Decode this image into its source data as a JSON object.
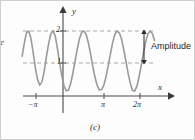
{
  "figure": {
    "caption": "(c)",
    "edge_fragment": "e",
    "axes": {
      "x_axis_label": "x",
      "y_axis_label": "y",
      "x_ticks": [
        {
          "label": "−π",
          "value": -3.14159,
          "px": 35
        },
        {
          "label": "π",
          "value": 3.14159,
          "px": 103
        },
        {
          "label": "2π",
          "value": 6.28319,
          "px": 139
        }
      ],
      "y_ticks": [
        {
          "label": "1",
          "value": 1,
          "px": 62
        },
        {
          "label": "2",
          "value": 2,
          "px": 30
        }
      ],
      "origin_px": {
        "x": 62,
        "y": 95
      },
      "x_arrow_tip_px": 170,
      "y_arrow_tip_px": 7
    },
    "annotation": {
      "label": "Amplitude",
      "arrow_x_px": 143,
      "arrow_top_px": 30,
      "arrow_bottom_px": 62,
      "label_x_px": 150,
      "label_y_px": 42
    },
    "guides": [
      {
        "name": "dashed-line-y-2",
        "y_value": 2,
        "y_px": 30,
        "style": "dashed"
      },
      {
        "name": "dashed-line-y-1",
        "y_value": 1,
        "y_px": 62,
        "style": "dashed"
      }
    ],
    "colors": {
      "curve": "#9a9a9a",
      "axis": "#4a4a4a",
      "dashed_guide": "#a9a9a9",
      "text": "#2b2b2b",
      "background": "#fdfdfd",
      "border": "#cfcfcf"
    }
  },
  "chart_data": {
    "type": "line",
    "title": "",
    "subtitle": "",
    "xlabel": "x",
    "ylabel": "y",
    "xlim": [
      -4.4,
      7.6
    ],
    "ylim": [
      -0.45,
      2.6
    ],
    "grid": false,
    "legend_position": "none",
    "curve_description": "Raised cosine: y = 1 + cos(2x), period π in screen scaling; minima touch y=0, maxima reach y=2",
    "function": "y = 1 + cos(2x)",
    "amplitude": 1,
    "midline": 1,
    "maximum": 2,
    "minimum": 0,
    "xticks": [
      -3.14159,
      3.14159,
      6.28319
    ],
    "xticklabels": [
      "−π",
      "π",
      "2π"
    ],
    "yticks": [
      1,
      2
    ],
    "yticklabels": [
      "1",
      "2"
    ],
    "annotations": [
      {
        "text": "Amplitude",
        "type": "double-headed-arrow",
        "from_y": 1,
        "to_y": 2
      }
    ],
    "series": [
      {
        "name": "y = 1 + cos(2x)",
        "color": "#9a9a9a",
        "x": [
          -4.4,
          -4.2,
          -4.0,
          -3.8,
          -3.6,
          -3.4,
          -3.2,
          -3.0,
          -2.8,
          -2.6,
          -2.4,
          -2.2,
          -2.0,
          -1.8,
          -1.6,
          -1.4,
          -1.2,
          -1.0,
          -0.8,
          -0.6,
          -0.4,
          -0.2,
          0.0,
          0.2,
          0.4,
          0.6,
          0.8,
          1.0,
          1.2,
          1.4,
          1.6,
          1.8,
          2.0,
          2.2,
          2.4,
          2.6,
          2.8,
          3.0,
          3.2,
          3.4,
          3.6,
          3.8,
          4.0,
          4.2,
          4.4,
          4.6,
          4.8,
          5.0,
          5.2,
          5.4,
          5.6,
          5.8,
          6.0,
          6.2,
          6.4,
          6.6,
          6.8,
          7.0,
          7.2,
          7.4,
          7.6
        ],
        "y": [
          1.21,
          1.62,
          1.95,
          2.0,
          1.77,
          1.33,
          0.85,
          0.48,
          0.31,
          0.41,
          0.74,
          1.19,
          1.6,
          1.91,
          2.0,
          1.85,
          1.46,
          1.0,
          0.6,
          0.28,
          0.13,
          0.15,
          0.36,
          0.68,
          1.06,
          1.44,
          1.76,
          1.96,
          2.0,
          1.89,
          1.64,
          1.29,
          0.9,
          0.56,
          0.3,
          0.16,
          0.17,
          0.3,
          0.56,
          0.91,
          1.28,
          1.63,
          1.89,
          2.0,
          1.95,
          1.76,
          1.44,
          1.07,
          0.69,
          0.37,
          0.15,
          0.12,
          0.27,
          0.57,
          0.94,
          1.32,
          1.67,
          1.91,
          2.0,
          1.92,
          1.7
        ]
      }
    ]
  }
}
